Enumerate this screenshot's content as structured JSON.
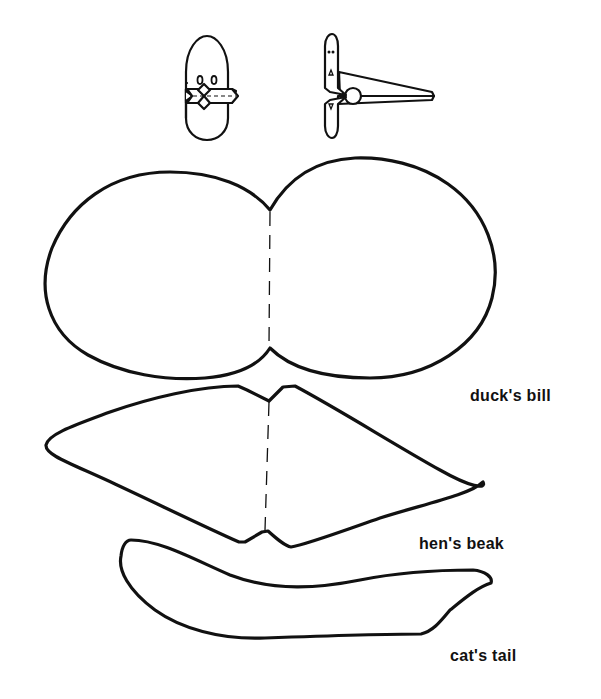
{
  "illustrations": [
    {
      "name": "puppet-front-view",
      "description": "Oval puppet head with two eyes and folded diamond mouth"
    },
    {
      "name": "puppet-side-view-with-clothespin",
      "description": "Puppet attached to a clothespin, side view"
    }
  ],
  "templates": [
    {
      "id": "duck-bill",
      "label": "duck's bill"
    },
    {
      "id": "hen-beak",
      "label": "hen's beak"
    },
    {
      "id": "cat-tail",
      "label": "cat's tail"
    }
  ],
  "colors": {
    "ink": "#111111",
    "paper": "#ffffff"
  }
}
